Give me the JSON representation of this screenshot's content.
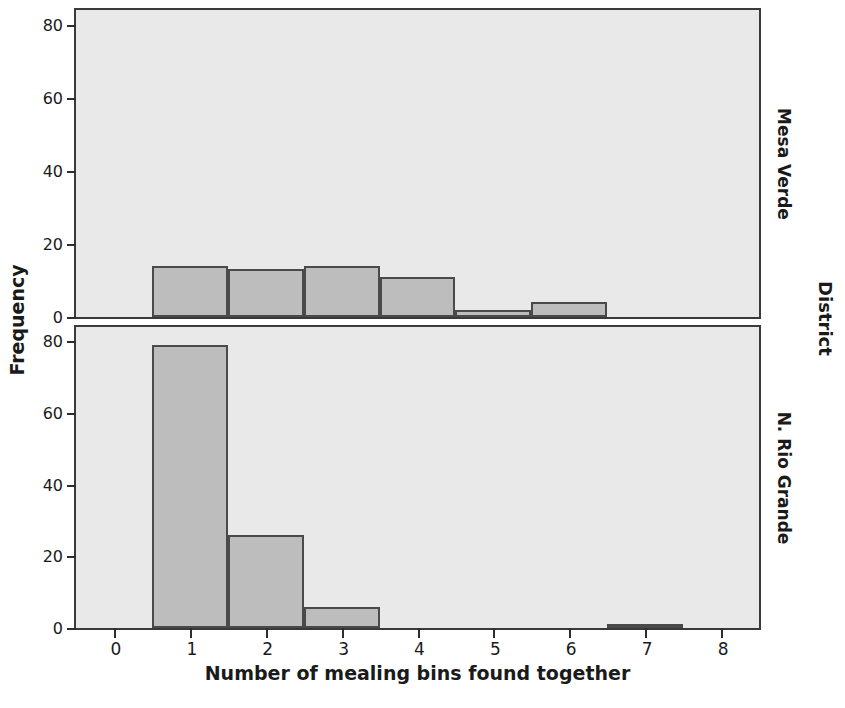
{
  "chart_data": {
    "type": "bar",
    "title": "",
    "xlabel": "Number of mealing bins found together",
    "ylabel": "Frequency",
    "outer_right_label": "District",
    "xlim": [
      -0.5,
      8.5
    ],
    "ylim": [
      0,
      84
    ],
    "x_ticks": [
      0,
      1,
      2,
      3,
      4,
      5,
      6,
      7,
      8
    ],
    "y_ticks": [
      0,
      20,
      40,
      60,
      80
    ],
    "grid": false,
    "legend": "none",
    "bar_fill": "#bdbdbd",
    "bar_edge": "#4a4a4a",
    "panel_background": "#e9e9e9",
    "panel_border": "#3a3a3a",
    "panels": [
      {
        "label": "Mesa Verde",
        "categories": [
          0,
          1,
          2,
          3,
          4,
          5,
          6,
          7,
          8
        ],
        "values": [
          0,
          14,
          13,
          14,
          11,
          2,
          4,
          0,
          0
        ]
      },
      {
        "label": "N. Rio Grande",
        "categories": [
          0,
          1,
          2,
          3,
          4,
          5,
          6,
          7,
          8
        ],
        "values": [
          0,
          79,
          26,
          6,
          0,
          0,
          0,
          1,
          0
        ]
      }
    ]
  }
}
